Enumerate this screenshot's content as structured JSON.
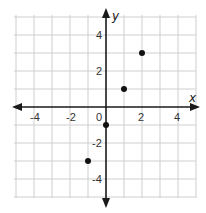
{
  "chart_data": {
    "type": "scatter",
    "title": "",
    "xlabel": "x",
    "ylabel": "y",
    "xlim": [
      -5,
      5
    ],
    "ylim": [
      -5,
      5
    ],
    "grid": true,
    "x_ticks": [
      -4,
      -2,
      0,
      2,
      4
    ],
    "y_ticks": [
      4,
      2,
      -2,
      -4
    ],
    "x_tick_labels": [
      "-4",
      "-2",
      "0",
      "2",
      "4"
    ],
    "y_tick_labels": [
      "4",
      "2",
      "-2",
      "-4"
    ],
    "origin_label": "0",
    "series": [
      {
        "name": "points",
        "points": [
          {
            "x": -1,
            "y": -3
          },
          {
            "x": 0,
            "y": -1
          },
          {
            "x": 1,
            "y": 1
          },
          {
            "x": 2,
            "y": 3
          }
        ]
      }
    ],
    "colors": {
      "grid": "#cfcfcf",
      "axis": "#1a1a1a",
      "point": "#111111"
    }
  }
}
